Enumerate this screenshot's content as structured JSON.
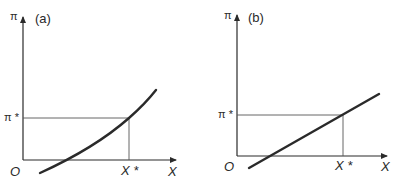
{
  "panels": [
    {
      "id": "a",
      "label": "(a)",
      "y_axis_label": "π",
      "x_axis_label": "X",
      "origin_label": "O",
      "y_marker_label": "π *",
      "x_marker_label": "X *",
      "curve_type": "convex increasing curve"
    },
    {
      "id": "b",
      "label": "(b)",
      "y_axis_label": "π",
      "x_axis_label": "X",
      "origin_label": "O",
      "y_marker_label": "π *",
      "x_marker_label": "X *",
      "curve_type": "straight increasing line"
    }
  ],
  "colors": {
    "ink": "#2a2a2a",
    "guide": "#555555",
    "background": "#ffffff"
  }
}
